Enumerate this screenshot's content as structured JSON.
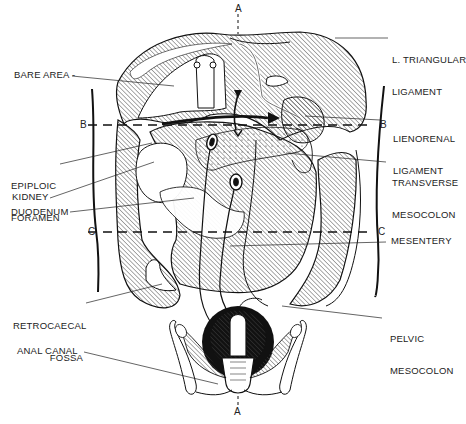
{
  "figure": {
    "type": "anatomical-diagram",
    "section_markers": {
      "a_top": "A",
      "a_bottom": "A",
      "b_left": "B",
      "b_right": "B",
      "c_left": "C",
      "c_right": "C"
    },
    "labels_left": [
      {
        "id": "bare-area",
        "text": "BARE AREA -"
      },
      {
        "id": "epiploic-foramen",
        "line1": "EPIPLOIC",
        "line2": "FORAMEN"
      },
      {
        "id": "kidney",
        "text": "KIDNEY"
      },
      {
        "id": "duodenum",
        "text": "DUODENUM"
      },
      {
        "id": "retrocaecal-fossa",
        "line1": "RETROCAECAL",
        "line2": "FOSSA"
      },
      {
        "id": "anal-canal",
        "text": "ANAL CANAL"
      }
    ],
    "labels_right": [
      {
        "id": "l-triangular-ligament",
        "line1": "L. TRIANGULAR",
        "line2": "LIGAMENT"
      },
      {
        "id": "lienorenal-ligament",
        "line1": "LIENORENAL",
        "line2": "LIGAMENT"
      },
      {
        "id": "transverse-mesocolon",
        "line1": "TRANSVERSE",
        "line2": "MESOCOLON"
      },
      {
        "id": "mesentery",
        "text": "MESENTERY"
      },
      {
        "id": "pelvic-mesocolon",
        "line1": "PELVIC",
        "line2": "MESOCOLON"
      }
    ]
  }
}
